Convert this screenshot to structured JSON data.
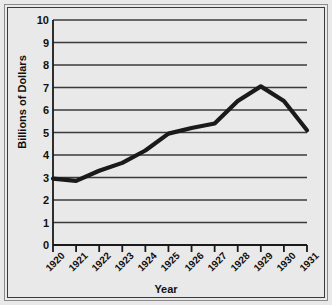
{
  "chart_data": {
    "type": "line",
    "title": "",
    "xlabel": "Year",
    "ylabel": "Billions of Dollars",
    "categories": [
      "1920",
      "1921",
      "1922",
      "1923",
      "1924",
      "1925",
      "1926",
      "1927",
      "1928",
      "1929",
      "1930",
      "1931"
    ],
    "x": [
      1920,
      1921,
      1922,
      1923,
      1924,
      1925,
      1926,
      1927,
      1928,
      1929,
      1930,
      1931
    ],
    "values": [
      2.95,
      2.85,
      3.3,
      3.65,
      4.2,
      4.95,
      5.2,
      5.4,
      6.4,
      7.05,
      6.4,
      5.1
    ],
    "series": [
      {
        "name": "Billions of Dollars",
        "values": [
          2.95,
          2.85,
          3.3,
          3.65,
          4.2,
          4.95,
          5.2,
          5.4,
          6.4,
          7.05,
          6.4,
          5.1
        ]
      }
    ],
    "ylim": [
      0,
      10
    ],
    "yticks": [
      "0",
      "1",
      "2",
      "3",
      "4",
      "5",
      "6",
      "7",
      "8",
      "9",
      "10"
    ],
    "ytick_values": [
      0,
      1,
      2,
      3,
      4,
      5,
      6,
      7,
      8,
      9,
      10
    ],
    "xlim": [
      1920,
      1931
    ],
    "grid": "horizontal",
    "legend": "none",
    "line_color": "#1a1a1a",
    "background_color": "#e9e9e9",
    "gridline_color": "#3a3a3a",
    "axis_color": "#1a1a1a"
  }
}
